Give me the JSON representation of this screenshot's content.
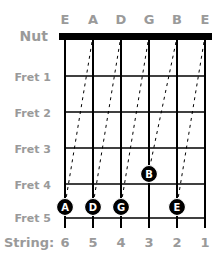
{
  "diagram": {
    "open_string_names": [
      "E",
      "A",
      "D",
      "G",
      "B",
      "E"
    ],
    "nut_label": "Nut",
    "fret_labels": [
      "Fret 1",
      "Fret 2",
      "Fret 3",
      "Fret 4",
      "Fret 5"
    ],
    "string_label": "String:",
    "string_numbers": [
      "6",
      "5",
      "4",
      "3",
      "2",
      "1"
    ],
    "notes": [
      {
        "label": "A",
        "string": 6,
        "fret": 5
      },
      {
        "label": "D",
        "string": 5,
        "fret": 5
      },
      {
        "label": "G",
        "string": 4,
        "fret": 5
      },
      {
        "label": "B",
        "string": 3,
        "fret": 4
      },
      {
        "label": "E",
        "string": 2,
        "fret": 5
      }
    ],
    "colors": {
      "label_gray": "#9a9a9a",
      "line": "#000000",
      "note_fill": "#000000",
      "note_text": "#ffffff"
    }
  }
}
